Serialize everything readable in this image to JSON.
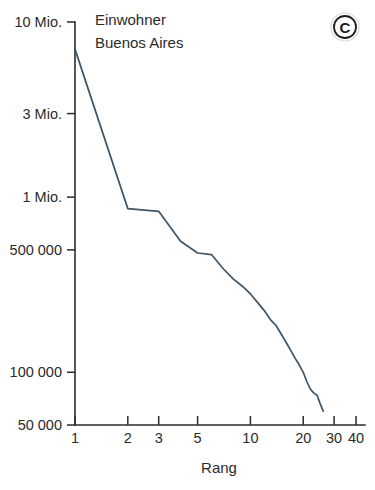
{
  "badge": {
    "letter": "C",
    "name": "panel-label-c"
  },
  "annotation": {
    "line1": "Einwohner",
    "line2": "Buenos Aires"
  },
  "chart_data": {
    "type": "line",
    "title": "",
    "subtitle": "",
    "annotations": [
      "Einwohner",
      "Buenos Aires"
    ],
    "xlabel": "Rang",
    "ylabel": "Einwohner",
    "xscale": "log",
    "yscale": "log",
    "xlim": [
      1,
      45
    ],
    "ylim": [
      50000,
      10000000
    ],
    "grid": false,
    "legend": null,
    "legend_position": "none",
    "xticks": [
      1,
      2,
      3,
      5,
      10,
      20,
      30,
      40
    ],
    "xticklabels": [
      "1",
      "2",
      "3",
      "5",
      "10",
      "20",
      "30",
      "40"
    ],
    "yticks": [
      10000000,
      3000000,
      1000000,
      500000,
      100000,
      50000
    ],
    "yticklabels": [
      "10 Mio.",
      "3 Mio.",
      "1 Mio.",
      "500 000",
      "100 000",
      "50 000"
    ],
    "series": [
      {
        "name": "Einwohner Buenos Aires",
        "color": "#3d5566",
        "x": [
          1,
          2,
          3,
          4,
          5,
          6,
          7,
          8,
          9,
          10,
          11,
          12,
          13,
          14,
          15,
          16,
          17,
          18,
          19,
          20,
          21,
          22,
          23,
          24,
          25,
          26
        ],
        "values": [
          7000000,
          860000,
          830000,
          560000,
          480000,
          470000,
          390000,
          340000,
          310000,
          280000,
          250000,
          225000,
          200000,
          185000,
          165000,
          148000,
          133000,
          120000,
          110000,
          100000,
          88000,
          80000,
          76000,
          74000,
          66000,
          60000
        ]
      }
    ]
  }
}
